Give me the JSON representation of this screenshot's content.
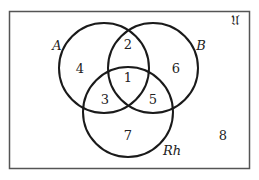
{
  "diagram": {
    "type": "venn",
    "universe": {
      "label": "𝔘",
      "region_outside_label": "8"
    },
    "sets": [
      {
        "name": "A",
        "label": "A"
      },
      {
        "name": "B",
        "label": "B"
      },
      {
        "name": "Rh",
        "label": "Rh"
      }
    ],
    "regions": {
      "A_B_Rh": "1",
      "A_B_only": "2",
      "A_Rh_only": "3",
      "A_only": "4",
      "B_Rh_only": "5",
      "B_only": "6",
      "Rh_only": "7",
      "none": "8"
    },
    "colors": {
      "stroke": "#1a1a1a",
      "frame": "#555555",
      "text": "#222222"
    }
  }
}
